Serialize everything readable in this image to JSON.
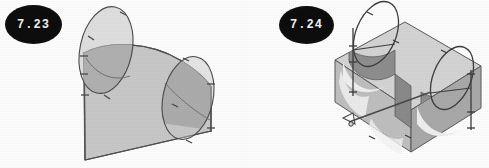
{
  "page": {
    "background_color": "#fdfdfd",
    "width": 489,
    "height": 168,
    "style": "scanned grayscale textbook figure plate"
  },
  "figures": [
    {
      "id": "fig-7-23",
      "label": "7.23",
      "badge": {
        "shape": "filled-ellipse",
        "fill_color": "#0d0d0d",
        "text_color": "#f2f2f2"
      },
      "caption_text": "7.23",
      "description": "Inclined quadrilateral plate with curved upper edge pierced by two oblique elliptical cylinders",
      "colors": {
        "surface_light": "#c9c9c9",
        "surface_mid": "#b4b4b4",
        "ellipse_overlap_dark": "#8f8f8f",
        "ellipse_upper_light": "#c2c2c2",
        "outline": "#4a4a4a",
        "edge_highlight": "#7a7a7a"
      },
      "elements": [
        "slanted-plate",
        "curved-top-edge",
        "left-ellipse",
        "right-ellipse",
        "left-vertical-edge",
        "right-vertical-edge",
        "bottom-edge",
        "vertex-tick-marks"
      ]
    },
    {
      "id": "fig-7-24",
      "label": "7.24",
      "badge": {
        "shape": "filled-ellipse",
        "fill_color": "#0d0d0d",
        "text_color": "#f2f2f2"
      },
      "caption_text": "7.24",
      "description": "Isometric rectangular block with two semicircular channel cut-outs and two wireframe elliptical loops rising above",
      "colors": {
        "block_top": "#d6d6d6",
        "block_front": "#c0c0c0",
        "block_side": "#a8a8a8",
        "channel_inner_dark": "#8d8d8d",
        "channel_inner_light": "#ececec",
        "wire_outline": "#3f3f3f",
        "outline": "#5a5a5a"
      },
      "elements": [
        "block-top-face",
        "block-front-face",
        "block-right-face",
        "channel-cutout-left",
        "channel-cutout-right",
        "wire-loop-left",
        "wire-loop-right",
        "connecting-rod",
        "vertex-tick-marks"
      ]
    }
  ]
}
